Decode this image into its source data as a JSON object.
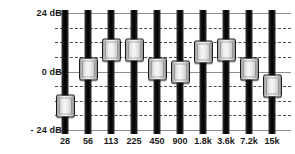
{
  "widget": {
    "name": "Graphic Equalizer",
    "unit": "dB"
  },
  "axis": {
    "labels": [
      {
        "text": "24 dB",
        "value": 24
      },
      {
        "text": "0 dB",
        "value": 0
      },
      {
        "text": "- 24 dB",
        "value": -24
      }
    ],
    "ymin": -24,
    "ymax": 24,
    "solid_ticks": [
      24,
      0,
      -24
    ],
    "dashed_ticks": [
      18,
      12,
      6,
      -6,
      -12,
      -18
    ],
    "grid_solid_color": "#8e8e8e",
    "grid_dashed_color": "#4a4a4a"
  },
  "chart_data": {
    "type": "bar",
    "title": "",
    "xlabel": "",
    "ylabel": "dB",
    "ylim": [
      -24,
      24
    ],
    "categories": [
      "28",
      "56",
      "113",
      "225",
      "450",
      "900",
      "1.8k",
      "3.6k",
      "7.2k",
      "15k"
    ],
    "values": [
      -14,
      1,
      9,
      9,
      1,
      0,
      8,
      9,
      1,
      -6
    ]
  },
  "bands": [
    {
      "freq": "28",
      "gain": -14
    },
    {
      "freq": "56",
      "gain": 1
    },
    {
      "freq": "113",
      "gain": 9
    },
    {
      "freq": "225",
      "gain": 9
    },
    {
      "freq": "450",
      "gain": 1
    },
    {
      "freq": "900",
      "gain": 0
    },
    {
      "freq": "1.8k",
      "gain": 8
    },
    {
      "freq": "3.6k",
      "gain": 9
    },
    {
      "freq": "7.2k",
      "gain": 1
    },
    {
      "freq": "15k",
      "gain": -6
    }
  ],
  "colors": {
    "background": "#ffffff",
    "track": "#000000",
    "thumb_light": "#f6f6f6",
    "thumb_dark": "#8a8a8a",
    "text": "#1a1a1a"
  }
}
